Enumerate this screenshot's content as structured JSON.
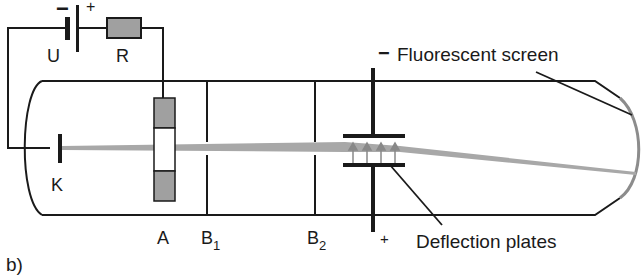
{
  "figure": {
    "panel_label": "b)",
    "colors": {
      "line": "#1a1a1a",
      "beam": "#a8a8a8",
      "electrode_fill": "#a0a0a0",
      "screen": "#8c8c8c"
    }
  },
  "labels": {
    "voltage_source": "U",
    "resistor": "R",
    "battery_minus": "−",
    "battery_plus": "+",
    "cathode": "K",
    "anode": "A",
    "aperture1": "B",
    "aperture1_sub": "1",
    "aperture2": "B",
    "aperture2_sub": "2",
    "plate_top_sign": "−",
    "plate_bottom_sign": "+",
    "screen": "Fluorescent screen",
    "plates": "Deflection plates"
  }
}
